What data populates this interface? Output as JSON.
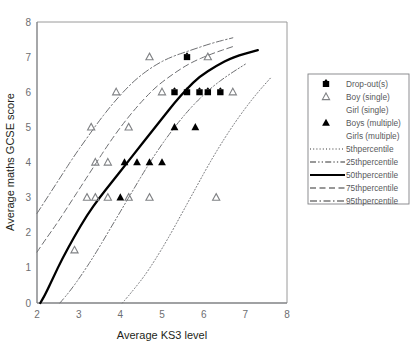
{
  "chart_data": {
    "type": "scatter",
    "title": "",
    "xlabel": "Average KS3 level",
    "ylabel": "Average maths GCSE score",
    "xlim": [
      2,
      8
    ],
    "ylim": [
      0,
      8
    ],
    "xticks": [
      2,
      3,
      4,
      5,
      6,
      7,
      8
    ],
    "yticks": [
      0,
      1,
      2,
      3,
      4,
      5,
      6,
      7,
      8
    ],
    "grid": false,
    "legend_position": "right",
    "series": [
      {
        "name": "Drop-out(s)",
        "marker": "filled-diamond",
        "points": [
          [
            5.3,
            6.0
          ],
          [
            5.6,
            6.0
          ],
          [
            5.9,
            6.0
          ],
          [
            6.1,
            6.0
          ],
          [
            6.4,
            6.0
          ],
          [
            5.6,
            7.0
          ]
        ]
      },
      {
        "name": "Boy (single)",
        "marker": "open-triangle",
        "points": [
          [
            2.9,
            1.5
          ],
          [
            3.2,
            3.0
          ],
          [
            3.4,
            3.0
          ],
          [
            3.7,
            3.0
          ],
          [
            4.2,
            3.0
          ],
          [
            4.7,
            3.0
          ],
          [
            6.3,
            3.0
          ],
          [
            3.4,
            4.0
          ],
          [
            3.7,
            4.0
          ],
          [
            3.3,
            5.0
          ],
          [
            4.2,
            5.0
          ],
          [
            3.9,
            6.0
          ],
          [
            5.0,
            6.0
          ],
          [
            6.7,
            6.0
          ],
          [
            4.7,
            7.0
          ],
          [
            6.1,
            7.0
          ]
        ]
      },
      {
        "name": "Girl (single)",
        "marker": "none",
        "points": []
      },
      {
        "name": "Boys (multiple)",
        "marker": "filled-triangle",
        "points": [
          [
            4.0,
            3.0
          ],
          [
            4.1,
            4.0
          ],
          [
            4.4,
            4.0
          ],
          [
            4.7,
            4.0
          ],
          [
            5.0,
            4.0
          ],
          [
            5.3,
            5.0
          ],
          [
            5.8,
            5.0
          ]
        ]
      },
      {
        "name": "Girls (multiple)",
        "marker": "none",
        "points": []
      }
    ],
    "curves": [
      {
        "name": "5thpercentile",
        "style": "dotted",
        "points": [
          [
            4.05,
            0
          ],
          [
            4.3,
            0.35
          ],
          [
            4.6,
            0.8
          ],
          [
            4.9,
            1.35
          ],
          [
            5.2,
            1.95
          ],
          [
            5.5,
            2.6
          ],
          [
            5.8,
            3.25
          ],
          [
            6.1,
            3.9
          ],
          [
            6.4,
            4.5
          ],
          [
            6.7,
            5.05
          ],
          [
            7.0,
            5.55
          ],
          [
            7.3,
            6.0
          ],
          [
            7.6,
            6.4
          ]
        ]
      },
      {
        "name": "25thpercentile",
        "style": "dash-dot-dot",
        "points": [
          [
            2.55,
            0
          ],
          [
            2.8,
            0.35
          ],
          [
            3.1,
            0.85
          ],
          [
            3.4,
            1.4
          ],
          [
            3.7,
            2.0
          ],
          [
            4.0,
            2.6
          ],
          [
            4.3,
            3.2
          ],
          [
            4.6,
            3.8
          ],
          [
            4.9,
            4.35
          ],
          [
            5.2,
            4.85
          ],
          [
            5.5,
            5.3
          ],
          [
            5.8,
            5.7
          ],
          [
            6.2,
            6.15
          ],
          [
            6.6,
            6.5
          ],
          [
            7.0,
            6.8
          ]
        ]
      },
      {
        "name": "50thpercentile",
        "style": "solid",
        "points": [
          [
            2.08,
            0
          ],
          [
            2.2,
            0.25
          ],
          [
            2.4,
            0.75
          ],
          [
            2.6,
            1.25
          ],
          [
            2.9,
            1.9
          ],
          [
            3.2,
            2.5
          ],
          [
            3.5,
            3.0
          ],
          [
            3.8,
            3.45
          ],
          [
            4.1,
            3.9
          ],
          [
            4.4,
            4.35
          ],
          [
            4.7,
            4.8
          ],
          [
            5.0,
            5.25
          ],
          [
            5.3,
            5.7
          ],
          [
            5.6,
            6.1
          ],
          [
            5.9,
            6.45
          ],
          [
            6.3,
            6.75
          ],
          [
            6.7,
            7.0
          ],
          [
            7.3,
            7.2
          ]
        ]
      },
      {
        "name": "75thpercentile",
        "style": "dashed",
        "points": [
          [
            2.0,
            1.45
          ],
          [
            2.2,
            1.8
          ],
          [
            2.5,
            2.3
          ],
          [
            2.8,
            2.85
          ],
          [
            3.1,
            3.4
          ],
          [
            3.4,
            3.95
          ],
          [
            3.7,
            4.5
          ],
          [
            4.0,
            5.0
          ],
          [
            4.3,
            5.45
          ],
          [
            4.6,
            5.85
          ],
          [
            4.9,
            6.2
          ],
          [
            5.3,
            6.55
          ],
          [
            5.7,
            6.85
          ],
          [
            6.2,
            7.1
          ],
          [
            6.7,
            7.3
          ]
        ]
      },
      {
        "name": "95thpercentile",
        "style": "dash-dot",
        "points": [
          [
            2.0,
            2.55
          ],
          [
            2.3,
            3.1
          ],
          [
            2.6,
            3.65
          ],
          [
            2.9,
            4.2
          ],
          [
            3.2,
            4.7
          ],
          [
            3.5,
            5.2
          ],
          [
            3.8,
            5.65
          ],
          [
            4.1,
            6.05
          ],
          [
            4.4,
            6.4
          ],
          [
            4.8,
            6.75
          ],
          [
            5.2,
            7.0
          ],
          [
            5.7,
            7.2
          ],
          [
            6.2,
            7.4
          ],
          [
            6.7,
            7.55
          ]
        ]
      }
    ],
    "legend": [
      {
        "label": "Drop-out(s)",
        "kind": "marker",
        "marker": "filled-diamond"
      },
      {
        "label": "Boy (single)",
        "kind": "marker",
        "marker": "open-triangle"
      },
      {
        "label": "Girl (single)",
        "kind": "marker",
        "marker": "none"
      },
      {
        "label": "Boys (multiple)",
        "kind": "marker",
        "marker": "filled-triangle"
      },
      {
        "label": "Girls (multiple)",
        "kind": "marker",
        "marker": "none"
      },
      {
        "label": "5thpercentile",
        "kind": "line",
        "style": "dotted"
      },
      {
        "label": "25thpercentile",
        "kind": "line",
        "style": "dash-dot-dot"
      },
      {
        "label": "50thpercentile",
        "kind": "line",
        "style": "solid"
      },
      {
        "label": "75thpercentile",
        "kind": "line",
        "style": "dashed"
      },
      {
        "label": "95thpercentile",
        "kind": "line",
        "style": "dash-dot"
      }
    ],
    "colors": {
      "axis": "#808285",
      "tick_text": "#6d6e71",
      "axis_title": "#231f20",
      "legend_text": "#58595b",
      "marker_fill": "#000000",
      "marker_open": "#808285",
      "curve_solid": "#000000",
      "curve_light": "#6d6e71",
      "legend_border": "#808285"
    }
  }
}
